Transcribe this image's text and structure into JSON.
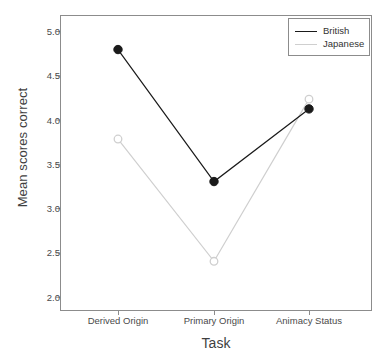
{
  "chart_data": {
    "type": "line",
    "title": "",
    "xlabel": "Task",
    "ylabel": "Mean scores correct",
    "categories": [
      "Derived Origin",
      "Primary Origin",
      "Animacy Status"
    ],
    "ylim": [
      1.85,
      5.18
    ],
    "yticks": [
      "2.0",
      "2.5",
      "3.0",
      "3.5",
      "4.0",
      "4.5",
      "5.0"
    ],
    "ytick_values": [
      2.0,
      2.5,
      3.0,
      3.5,
      4.0,
      4.5,
      5.0
    ],
    "grid": false,
    "legend_position": "top-right",
    "series": [
      {
        "name": "British",
        "values": [
          4.79,
          3.3,
          4.12
        ],
        "color": "#1a1a1a",
        "marker": "filled-circle"
      },
      {
        "name": "Japanese",
        "values": [
          3.78,
          2.4,
          4.23
        ],
        "color": "#cfcfcf",
        "marker": "open-circle"
      }
    ]
  },
  "legend": {
    "entries": [
      {
        "label": "British"
      },
      {
        "label": "Japanese"
      }
    ]
  },
  "axes": {
    "y_title": "Mean scores correct",
    "x_title": "Task"
  },
  "colors": {
    "british": "#1a1a1a",
    "japanese": "#cfcfcf",
    "panel_border": "#8c8c8c",
    "tick_label": "#4a4a4a",
    "background": "#ffffff"
  }
}
